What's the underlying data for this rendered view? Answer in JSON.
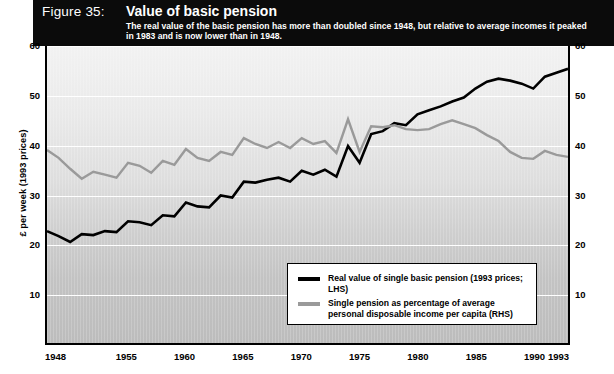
{
  "header": {
    "figure_label": "Figure 35:",
    "title": "Value of basic pension",
    "subtitle": "The real value of the basic pension has more than doubled since 1948, but relative to average incomes it peaked in 1983 and is now lower than in 1948."
  },
  "legend": {
    "items": [
      {
        "label": "Real value of single basic pension (1993 prices; LHS)",
        "color": "#000000"
      },
      {
        "label": "Single pension as percentage of average personal disposable income per capita (RHS)",
        "color": "#9a9a9a"
      }
    ]
  },
  "axes": {
    "left_title": "£ per week (1993 prices)",
    "right_title": "Percentage of average personal disposable income per capita",
    "y_ticks": [
      "10",
      "20",
      "30",
      "40",
      "50",
      "60"
    ],
    "x_ticks": [
      "1948",
      "1955",
      "1960",
      "1965",
      "1970",
      "1975",
      "1980",
      "1985",
      "1990",
      "1993"
    ]
  },
  "chart_data": {
    "type": "line",
    "title": "Value of basic pension",
    "subtitle": "The real value of the basic pension has more than doubled since 1948, but relative to average incomes it peaked in 1983 and is now lower than in 1948.",
    "xlabel": "",
    "ylabel": "£ per week (1993 prices)",
    "y2label": "Percentage of average personal disposable income per capita",
    "xlim": [
      1948,
      1993
    ],
    "ylim": [
      0,
      60
    ],
    "y2lim": [
      0,
      60
    ],
    "yticks": [
      10,
      20,
      30,
      40,
      50,
      60
    ],
    "xticks": [
      1948,
      1955,
      1960,
      1965,
      1970,
      1975,
      1980,
      1985,
      1990,
      1993
    ],
    "grid": "horizontal-white",
    "legend_position": "inside-bottom-right",
    "x": [
      1948,
      1949,
      1950,
      1951,
      1952,
      1953,
      1954,
      1955,
      1956,
      1957,
      1958,
      1959,
      1960,
      1961,
      1962,
      1963,
      1964,
      1965,
      1966,
      1967,
      1968,
      1969,
      1970,
      1971,
      1972,
      1973,
      1974,
      1975,
      1976,
      1977,
      1978,
      1979,
      1980,
      1981,
      1982,
      1983,
      1984,
      1985,
      1986,
      1987,
      1988,
      1989,
      1990,
      1991,
      1992,
      1993
    ],
    "series": [
      {
        "name": "Real value of single basic pension (1993 prices; LHS)",
        "axis": "left",
        "color": "#000000",
        "values": [
          22.6,
          21.6,
          20.4,
          22.0,
          21.8,
          22.6,
          22.4,
          24.6,
          24.4,
          23.8,
          25.8,
          25.6,
          28.4,
          27.6,
          27.4,
          29.8,
          29.4,
          32.6,
          32.4,
          33.0,
          33.4,
          32.6,
          34.8,
          34.0,
          35.0,
          33.6,
          39.8,
          36.4,
          42.2,
          42.8,
          44.4,
          44.0,
          46.2,
          47.0,
          47.8,
          48.8,
          49.6,
          51.4,
          52.8,
          53.4,
          53.0,
          52.4,
          51.4,
          53.8,
          54.6,
          55.4
        ]
      },
      {
        "name": "Single pension as percentage of average personal disposable income per capita (RHS)",
        "axis": "right",
        "color": "#9a9a9a",
        "values": [
          39.0,
          37.4,
          35.2,
          33.2,
          34.6,
          34.0,
          33.4,
          36.4,
          35.8,
          34.4,
          36.8,
          36.0,
          39.2,
          37.4,
          36.8,
          38.6,
          38.0,
          41.4,
          40.2,
          39.4,
          40.6,
          39.4,
          41.4,
          40.2,
          40.8,
          38.4,
          45.2,
          38.6,
          43.8,
          43.6,
          44.0,
          43.2,
          43.0,
          43.2,
          44.2,
          45.0,
          44.2,
          43.4,
          42.0,
          40.8,
          38.6,
          37.4,
          37.2,
          38.8,
          38.0,
          37.6
        ]
      }
    ]
  }
}
